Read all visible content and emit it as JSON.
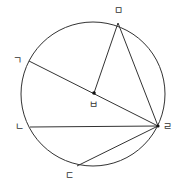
{
  "diagram": {
    "type": "circle-geometry",
    "circle": {
      "cx": 93,
      "cy": 94,
      "r": 72
    },
    "points": [
      {
        "id": "g",
        "label": "ㄱ",
        "x": 29,
        "y": 61,
        "label_x": 13,
        "label_y": 56
      },
      {
        "id": "n",
        "label": "ㄴ",
        "x": 30,
        "y": 127,
        "label_x": 15,
        "label_y": 122
      },
      {
        "id": "d",
        "label": "ㄷ",
        "x": 77,
        "y": 166,
        "label_x": 65,
        "label_y": 171
      },
      {
        "id": "r",
        "label": "ㄹ",
        "x": 158,
        "y": 126,
        "label_x": 163,
        "label_y": 122
      },
      {
        "id": "m",
        "label": "ㅁ",
        "x": 118,
        "y": 23,
        "label_x": 114,
        "label_y": 6
      },
      {
        "id": "b",
        "label": "ㅂ",
        "x": 94,
        "y": 93,
        "label_x": 89,
        "label_y": 100
      }
    ],
    "segments": [
      [
        "g",
        "r"
      ],
      [
        "b",
        "m"
      ],
      [
        "m",
        "r"
      ],
      [
        "n",
        "r"
      ],
      [
        "d",
        "r"
      ]
    ],
    "stroke_color": "#333333"
  }
}
